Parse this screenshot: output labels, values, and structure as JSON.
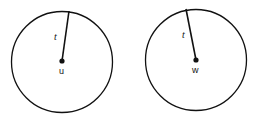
{
  "diagram": {
    "circles": [
      {
        "center_label": "u",
        "radius_label": "t",
        "center": [
          62,
          61
        ],
        "radius": 51,
        "radius_end": [
          69,
          11
        ]
      },
      {
        "center_label": "w",
        "radius_label": "t",
        "center": [
          196,
          60
        ],
        "radius": 51,
        "radius_end": [
          186,
          9
        ]
      }
    ],
    "stroke_color": "#111111",
    "background": "#ffffff"
  }
}
